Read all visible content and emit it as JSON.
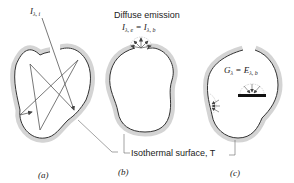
{
  "diagram": {
    "panels": [
      {
        "id": "a",
        "caption": "(a)",
        "incident_label": {
          "symbol": "I",
          "subscript": "λ, i"
        },
        "description": "Incident radiation enters cavity opening and undergoes multiple reflections (complete absorption)"
      },
      {
        "id": "b",
        "caption": "(b)",
        "emission_title": "Diffuse emission",
        "emission_label": {
          "lhs": "I",
          "lhs_sub": "λ, e",
          "eq": " = ",
          "rhs": "I",
          "rhs_sub": "λ, b"
        },
        "description": "Diffuse emission from the aperture"
      },
      {
        "id": "c",
        "caption": "(c)",
        "irradiation_label": {
          "lhs": "G",
          "lhs_sub": "λ",
          "eq": " = ",
          "rhs": "E",
          "rhs_sub": "λ, b"
        },
        "description": "Diffuse irradiation of interior surfaces and of a small object in the cavity"
      }
    ],
    "shared_label": "Isothermal surface, T",
    "colors": {
      "wall_shade": "#d4d4d4",
      "line": "#333333",
      "ray": "#555555"
    }
  }
}
